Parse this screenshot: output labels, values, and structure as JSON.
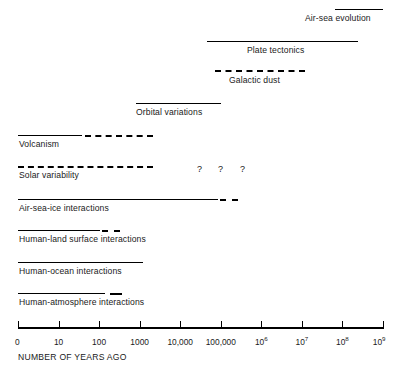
{
  "chart_data": {
    "type": "bar",
    "title": "",
    "subtitle": "",
    "xlabel": "NUMBER OF YEARS AGO",
    "ylabel": "",
    "orientation": "horizontal",
    "xscale": "log",
    "grid": false,
    "legend": "none",
    "axis": {
      "label": "NUMBER OF YEARS AGO",
      "tick_labels": [
        "0",
        "10",
        "100",
        "1000",
        "10,000",
        "100,000",
        "10^6",
        "10^7",
        "10^8",
        "10^9"
      ],
      "tick_values": [
        0,
        10,
        100,
        1000,
        10000,
        100000,
        1000000,
        10000000,
        100000000,
        1000000000
      ],
      "tick_display": [
        {
          "text": "0",
          "sup": ""
        },
        {
          "text": "10",
          "sup": ""
        },
        {
          "text": "100",
          "sup": ""
        },
        {
          "text": "1000",
          "sup": ""
        },
        {
          "text": "10,000",
          "sup": ""
        },
        {
          "text": "100,000",
          "sup": ""
        },
        {
          "text": "10",
          "sup": "6"
        },
        {
          "text": "10",
          "sup": "7"
        },
        {
          "text": "10",
          "sup": "8"
        },
        {
          "text": "10",
          "sup": "9"
        }
      ],
      "decade_positions_px": [
        18,
        58.6,
        99.1,
        139.7,
        180.2,
        220.8,
        261.3,
        301.9,
        342.4,
        383
      ]
    },
    "categories": [
      "Air-sea evolution",
      "Plate tectonics",
      "Galactic dust",
      "Orbital variations",
      "Volcanism",
      "Solar variability",
      "Air-sea-ice interactions",
      "Human-land surface interactions",
      "Human-ocean interactions",
      "Human-atmosphere interactions"
    ],
    "bars": [
      {
        "label": "Air-sea evolution",
        "row_index": 0,
        "solid": {
          "start_decade": 7.82,
          "end_decade": 9.0,
          "start_px": 335,
          "end_px": 383
        },
        "dashed": null,
        "question_marks": [],
        "label_align": "right"
      },
      {
        "label": "Plate tectonics",
        "row_index": 1,
        "solid": {
          "start_decade": 4.66,
          "end_decade": 8.39,
          "start_px": 207,
          "end_px": 358
        },
        "dashed": null,
        "question_marks": [],
        "label_align": "center"
      },
      {
        "label": "Galactic dust",
        "row_index": 2,
        "solid": null,
        "dashed": {
          "start_decade": 4.86,
          "end_decade": 7.08,
          "start_px": 215,
          "end_px": 305
        },
        "question_marks": [],
        "label_align": "center"
      },
      {
        "label": "Orbital variations",
        "row_index": 3,
        "solid": {
          "start_decade": 2.91,
          "end_decade": 5.01,
          "start_px": 136,
          "end_px": 221
        },
        "dashed": null,
        "question_marks": [],
        "label_align": "left"
      },
      {
        "label": "Volcanism",
        "row_index": 4,
        "solid": {
          "start_decade": 0.0,
          "end_decade": 1.58,
          "start_px": 18,
          "end_px": 82
        },
        "dashed": {
          "start_decade": 1.65,
          "end_decade": 3.33,
          "start_px": 85,
          "end_px": 153
        },
        "question_marks": [],
        "label_align": "left"
      },
      {
        "label": "Solar variability",
        "row_index": 5,
        "solid": null,
        "dashed": {
          "start_decade": 0.0,
          "end_decade": 3.33,
          "start_px": 18,
          "end_px": 153
        },
        "question_marks": [
          197,
          218,
          240
        ],
        "label_align": "left"
      },
      {
        "label": "Air-sea-ice interactions",
        "row_index": 6,
        "solid": {
          "start_decade": 0.0,
          "end_decade": 4.93,
          "start_px": 18,
          "end_px": 218
        },
        "dashed": {
          "start_decade": 4.98,
          "end_decade": 5.43,
          "start_px": 220,
          "end_px": 238
        },
        "question_marks": [],
        "label_align": "left"
      },
      {
        "label": "Human-land surface interactions",
        "row_index": 7,
        "solid": {
          "start_decade": 0.0,
          "end_decade": 2.02,
          "start_px": 18,
          "end_px": 100
        },
        "dashed": {
          "start_decade": 2.07,
          "end_decade": 2.52,
          "start_px": 102,
          "end_px": 120
        },
        "question_marks": [],
        "label_align": "left"
      },
      {
        "label": "Human-ocean interactions",
        "row_index": 8,
        "solid": {
          "start_decade": 0.0,
          "end_decade": 3.08,
          "start_px": 18,
          "end_px": 143
        },
        "dashed": null,
        "question_marks": [],
        "label_align": "left"
      },
      {
        "label": "Human-atmosphere interactions",
        "row_index": 9,
        "solid": {
          "start_decade": 0.0,
          "end_decade": 2.15,
          "start_px": 18,
          "end_px": 105
        },
        "dashed": {
          "start_decade": 2.27,
          "end_decade": 2.57,
          "start_px": 110,
          "end_px": 122
        },
        "question_marks": [],
        "label_align": "left"
      }
    ],
    "annotations": [
      {
        "text": "?",
        "x_px": 197,
        "row_index": 5
      },
      {
        "text": "?",
        "x_px": 218,
        "row_index": 5
      },
      {
        "text": "?",
        "x_px": 240,
        "row_index": 5
      }
    ],
    "colors": {
      "line": "#000000",
      "text": "#1a1a1a",
      "background": "#ffffff"
    }
  },
  "rows": [
    {
      "label": "Air-sea evolution",
      "bar_top": 9,
      "label_left": 305,
      "label_top": 13
    },
    {
      "label": "Plate tectonics",
      "bar_top": 41,
      "label_top": 45,
      "label_left": 247
    },
    {
      "label": "Galactic dust",
      "bar_top": 70,
      "label_top": 75,
      "label_left": 229
    },
    {
      "label": "Orbital variations",
      "bar_top": 103,
      "label_top": 107,
      "label_left": 136
    },
    {
      "label": "Volcanism",
      "bar_top": 135,
      "label_top": 139,
      "label_left": 19
    },
    {
      "label": "Solar variability",
      "bar_top": 166,
      "label_top": 170,
      "label_left": 19
    },
    {
      "label": "Air-sea-ice interactions",
      "bar_top": 199,
      "label_top": 203,
      "label_left": 19
    },
    {
      "label": "Human-land surface interactions",
      "bar_top": 230,
      "label_top": 234,
      "label_left": 19
    },
    {
      "label": "Human-ocean interactions",
      "bar_top": 262,
      "label_top": 266,
      "label_left": 19
    },
    {
      "label": "Human-atmosphere interactions",
      "bar_top": 293,
      "label_top": 297,
      "label_left": 19
    }
  ],
  "axis": {
    "title": "NUMBER OF YEARS AGO",
    "line_top": 327,
    "line_left": 18,
    "line_right": 383,
    "tick_top": 321,
    "tick_height": 8,
    "tick_label_top": 337,
    "title_top": 352,
    "title_left": 18
  }
}
